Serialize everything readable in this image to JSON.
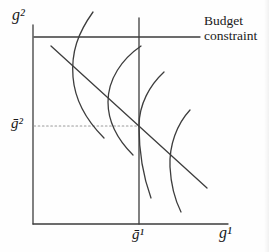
{
  "figure": {
    "labels": {
      "y_axis": "g²",
      "x_axis": "g¹",
      "y_value": "ḡ²",
      "x_value": "ḡ¹",
      "budget_constraint": "Budget constraint"
    },
    "colors": {
      "line": "#3d3d3d",
      "dotted_line": "#9a9a9a",
      "text": "#1a1a1a",
      "background": "#fefefe"
    },
    "paths": {
      "y_axis": "M 33 25 L 33 224",
      "x_axis": "M 33 224 L 228 224",
      "top_boundary_line": "M 34 37 L 200 37",
      "gbar1_vertical_line": "M 139 18 L 139 224",
      "gbar2_dotted_line": "M 34 126 L 139 126",
      "budget_line": "M 51 46 L 207 188",
      "indifference_curve_1": "M 93 12 C 78 33 71 52 73 77 C 75 102 89 123 104 138",
      "indifference_curve_2": "M 141 46 C 122 59 108 79 108 102 C 108 124 119 141 133 155",
      "indifference_curve_3": "M 164 72 C 150 85 139 104 139 126 C 139 152 143 176 151 198",
      "indifference_curve_4": "M 190 110 C 177 124 169 145 170 167 C 171 186 175 200 181 212"
    }
  }
}
